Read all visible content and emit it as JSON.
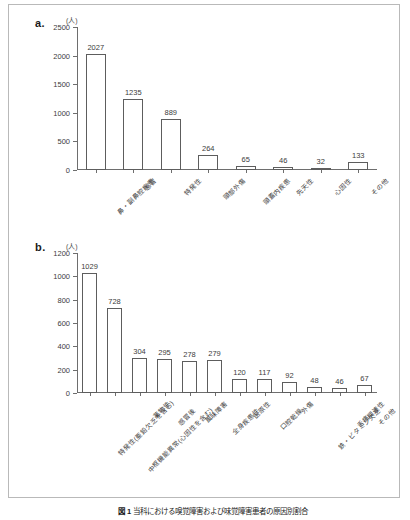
{
  "figure": {
    "panel_a_letter": "a.",
    "panel_b_letter": "b.",
    "unit": "(人)",
    "caption_prefix": "図 1",
    "caption_text": "当科における嗅覚障害および味覚障害患者の原因別割合"
  },
  "chart_data": [
    {
      "type": "bar",
      "panel": "a",
      "title": "",
      "xlabel": "",
      "ylabel": "(人)",
      "ylim": [
        0,
        2500
      ],
      "yticks": [
        0,
        500,
        1000,
        1500,
        2000,
        2500
      ],
      "grid": false,
      "legend": "none",
      "categories": [
        "鼻・副鼻腔疾患",
        "感冒",
        "特発性",
        "頭部外傷",
        "頭蓋内疾患",
        "先天性",
        "心因性",
        "その他"
      ],
      "values": [
        2027,
        1235,
        889,
        264,
        65,
        46,
        32,
        133
      ],
      "data_labels": [
        "2027",
        "1235",
        "889",
        "264",
        "65",
        "46",
        "32",
        "133"
      ]
    },
    {
      "type": "bar",
      "panel": "b",
      "title": "",
      "xlabel": "",
      "ylabel": "(人)",
      "ylim": [
        0,
        1200
      ],
      "yticks": [
        0,
        200,
        400,
        600,
        800,
        1000,
        1200
      ],
      "grid": false,
      "legend": "none",
      "categories": [
        "特発性(亜鉛欠乏を含む)",
        "中枢機能異常(心因性を含む)",
        "薬物性",
        "感冒後",
        "風味障害",
        "全身疾患性",
        "医原性",
        "口腔乾燥",
        "外傷",
        "鉄・ビタミン欠乏",
        "舌痛関連性",
        "その他"
      ],
      "values": [
        1029,
        728,
        304,
        295,
        278,
        279,
        120,
        117,
        92,
        48,
        46,
        67
      ],
      "data_labels": [
        "1029",
        "728",
        "304",
        "295",
        "278",
        "279",
        "120",
        "117",
        "92",
        "48",
        "46",
        "67"
      ]
    }
  ]
}
